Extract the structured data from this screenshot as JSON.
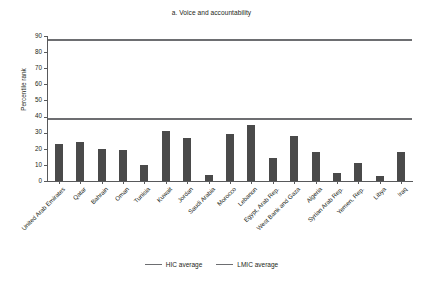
{
  "chart_data": {
    "type": "bar",
    "title": "a. Voice and accountability",
    "xlabel": "",
    "ylabel": "Percentile rank",
    "ylim": [
      0,
      90
    ],
    "ytick_step": 10,
    "yticks": [
      0,
      10,
      20,
      30,
      40,
      50,
      60,
      70,
      80,
      90
    ],
    "grid": false,
    "legend_position": "bottom",
    "bar_color": "#4a4a4a",
    "reference_line_color": "#6d6e71",
    "categories": [
      "United Arab Emirates",
      "Qatar",
      "Bahrain",
      "Oman",
      "Tunisia",
      "Kuwait",
      "Jordan",
      "Saudi Arabia",
      "Morocco",
      "Lebanon",
      "Egypt, Arab Rep.",
      "West Bank and Gaza",
      "Algeria",
      "Syrian Arab Rep.",
      "Yemen, Rep.",
      "Libya",
      "Iraq"
    ],
    "values": [
      23,
      24,
      20,
      19,
      10,
      31,
      27,
      4,
      29,
      35,
      14,
      28,
      18,
      5,
      11,
      3,
      18
    ],
    "reference_lines": [
      {
        "name": "HIC average",
        "value": 88
      },
      {
        "name": "LMIC average",
        "value": 39
      }
    ]
  },
  "legend": {
    "items": [
      {
        "label": "HIC average"
      },
      {
        "label": "LMIC average"
      }
    ]
  }
}
